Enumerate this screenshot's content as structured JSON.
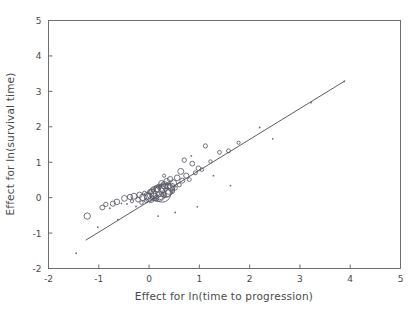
{
  "chart_data": {
    "type": "scatter",
    "title": "",
    "subtitle": "",
    "xlabel": "Effect for ln(time to progression)",
    "ylabel": "Effect for ln(survival time)",
    "xlim": [
      -2,
      5
    ],
    "ylim": [
      -2,
      5
    ],
    "xticks": [
      -2,
      -1,
      0,
      1,
      2,
      3,
      4,
      5
    ],
    "yticks": [
      -2,
      -1,
      0,
      1,
      2,
      3,
      4,
      5
    ],
    "xtick_labels": [
      "-2",
      "-1",
      "0",
      "1",
      "2",
      "3",
      "4",
      "5"
    ],
    "ytick_labels": [
      "-2",
      "-1",
      "0",
      "1",
      "2",
      "3",
      "4",
      "5"
    ],
    "grid": false,
    "legend": null,
    "marker": "open-circle-sized-by-weight",
    "annotations": [],
    "fit_line": {
      "type": "line",
      "x": [
        -1.26,
        3.9
      ],
      "y": [
        -1.2,
        3.3
      ],
      "slope": 0.873,
      "intercept": -0.1
    },
    "points": [
      {
        "x": -1.45,
        "y": -1.57,
        "size": 1.0
      },
      {
        "x": -1.23,
        "y": -0.52,
        "size": 3.2
      },
      {
        "x": -1.02,
        "y": -0.83,
        "size": 1.2
      },
      {
        "x": -0.93,
        "y": -0.28,
        "size": 2.4
      },
      {
        "x": -0.86,
        "y": -0.19,
        "size": 2.2
      },
      {
        "x": -0.78,
        "y": -0.3,
        "size": 1.4
      },
      {
        "x": -0.72,
        "y": -0.17,
        "size": 2.6
      },
      {
        "x": -0.64,
        "y": -0.12,
        "size": 2.8
      },
      {
        "x": -0.55,
        "y": -0.16,
        "size": 1.5
      },
      {
        "x": -0.49,
        "y": -0.02,
        "size": 2.9
      },
      {
        "x": -0.44,
        "y": -0.18,
        "size": 1.3
      },
      {
        "x": -0.38,
        "y": 0.02,
        "size": 2.6
      },
      {
        "x": -0.34,
        "y": -0.1,
        "size": 1.6
      },
      {
        "x": -0.3,
        "y": 0.04,
        "size": 3.0
      },
      {
        "x": -0.26,
        "y": -0.25,
        "size": 1.2
      },
      {
        "x": -0.22,
        "y": -0.06,
        "size": 2.3
      },
      {
        "x": -0.19,
        "y": 0.08,
        "size": 2.7
      },
      {
        "x": -0.15,
        "y": -0.14,
        "size": 1.8
      },
      {
        "x": -0.12,
        "y": 0.01,
        "size": 3.4
      },
      {
        "x": -0.09,
        "y": 0.12,
        "size": 2.1
      },
      {
        "x": -0.06,
        "y": -0.08,
        "size": 2.0
      },
      {
        "x": -0.03,
        "y": 0.05,
        "size": 3.6
      },
      {
        "x": 0.0,
        "y": 0.0,
        "size": 4.2
      },
      {
        "x": 0.02,
        "y": 0.16,
        "size": 2.5
      },
      {
        "x": 0.04,
        "y": -0.05,
        "size": 3.1
      },
      {
        "x": 0.06,
        "y": 0.09,
        "size": 5.0
      },
      {
        "x": 0.08,
        "y": 0.22,
        "size": 2.2
      },
      {
        "x": 0.1,
        "y": 0.02,
        "size": 3.8
      },
      {
        "x": 0.12,
        "y": 0.14,
        "size": 6.2
      },
      {
        "x": 0.14,
        "y": -0.02,
        "size": 2.8
      },
      {
        "x": 0.16,
        "y": 0.26,
        "size": 3.3
      },
      {
        "x": 0.18,
        "y": 0.1,
        "size": 7.4
      },
      {
        "x": 0.2,
        "y": 0.31,
        "size": 2.6
      },
      {
        "x": 0.21,
        "y": 0.05,
        "size": 4.0
      },
      {
        "x": 0.23,
        "y": 0.19,
        "size": 5.6
      },
      {
        "x": 0.25,
        "y": 0.4,
        "size": 3.0
      },
      {
        "x": 0.26,
        "y": 0.12,
        "size": 8.8
      },
      {
        "x": 0.28,
        "y": 0.28,
        "size": 4.6
      },
      {
        "x": 0.3,
        "y": 0.07,
        "size": 2.4
      },
      {
        "x": 0.31,
        "y": 0.35,
        "size": 3.6
      },
      {
        "x": 0.33,
        "y": 0.2,
        "size": 6.8
      },
      {
        "x": 0.35,
        "y": 0.46,
        "size": 2.9
      },
      {
        "x": 0.36,
        "y": 0.15,
        "size": 4.4
      },
      {
        "x": 0.38,
        "y": 0.33,
        "size": 3.1
      },
      {
        "x": 0.4,
        "y": 0.24,
        "size": 5.2
      },
      {
        "x": 0.42,
        "y": 0.52,
        "size": 2.7
      },
      {
        "x": 0.44,
        "y": 0.3,
        "size": 3.9
      },
      {
        "x": 0.46,
        "y": 0.18,
        "size": 2.3
      },
      {
        "x": 0.48,
        "y": 0.41,
        "size": 3.4
      },
      {
        "x": 0.52,
        "y": 0.27,
        "size": 2.1
      },
      {
        "x": 0.56,
        "y": 0.56,
        "size": 2.8
      },
      {
        "x": 0.6,
        "y": 0.36,
        "size": 2.0
      },
      {
        "x": 0.63,
        "y": 0.74,
        "size": 3.0
      },
      {
        "x": 0.66,
        "y": 0.48,
        "size": 2.5
      },
      {
        "x": 0.7,
        "y": 1.06,
        "size": 2.2
      },
      {
        "x": 0.74,
        "y": 0.62,
        "size": 2.6
      },
      {
        "x": 0.8,
        "y": 0.51,
        "size": 1.9
      },
      {
        "x": 0.86,
        "y": 0.96,
        "size": 2.4
      },
      {
        "x": 0.92,
        "y": 0.7,
        "size": 2.0
      },
      {
        "x": 0.98,
        "y": 0.83,
        "size": 2.3
      },
      {
        "x": 1.05,
        "y": 0.79,
        "size": 1.8
      },
      {
        "x": 1.12,
        "y": 1.46,
        "size": 2.1
      },
      {
        "x": 1.22,
        "y": 1.02,
        "size": 1.7
      },
      {
        "x": 1.4,
        "y": 1.28,
        "size": 1.9
      },
      {
        "x": 1.58,
        "y": 1.32,
        "size": 2.0
      },
      {
        "x": 1.78,
        "y": 1.55,
        "size": 1.6
      },
      {
        "x": 2.2,
        "y": 1.98,
        "size": 1.5
      },
      {
        "x": 2.46,
        "y": 1.66,
        "size": 1.4
      },
      {
        "x": 3.22,
        "y": 2.68,
        "size": 1.5
      },
      {
        "x": 3.88,
        "y": 3.28,
        "size": 1.4
      },
      {
        "x": 0.52,
        "y": -0.42,
        "size": 1.3
      },
      {
        "x": 0.96,
        "y": -0.26,
        "size": 1.2
      },
      {
        "x": 1.62,
        "y": 0.34,
        "size": 1.3
      },
      {
        "x": -0.62,
        "y": -0.62,
        "size": 1.2
      },
      {
        "x": 0.18,
        "y": -0.52,
        "size": 1.4
      },
      {
        "x": 1.28,
        "y": 0.62,
        "size": 1.5
      },
      {
        "x": 0.3,
        "y": 0.62,
        "size": 1.6
      },
      {
        "x": 0.84,
        "y": 1.18,
        "size": 1.5
      }
    ]
  }
}
